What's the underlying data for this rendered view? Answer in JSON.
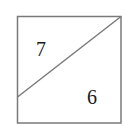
{
  "diagram": {
    "type": "square split by diagonal",
    "regions": [
      {
        "name": "upper-left-triangle",
        "label": "7"
      },
      {
        "name": "lower-right-region",
        "label": "6"
      }
    ],
    "colors": {
      "stroke": "#7a7a7a",
      "text": "#1a1a1a",
      "background": "#ffffff"
    }
  }
}
